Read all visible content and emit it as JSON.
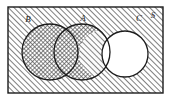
{
  "figure": {
    "kind": "venn-diagram",
    "title": "",
    "background_color": "#ffffff",
    "stroke_color": "#1c1c1c",
    "hatch_color": "#4a4a4a",
    "fill_white": "#ffffff"
  },
  "universe": {
    "label": "S",
    "shape": "rectangle",
    "x": 8,
    "y": 7,
    "width": 155,
    "height": 86,
    "fill_pattern": "diagonal-hatch",
    "label_x": 152,
    "label_y": 19
  },
  "sets": [
    {
      "label": "B",
      "shape": "circle",
      "cx": 50,
      "cy": 52,
      "r": 28,
      "fill_pattern": "cross-hatch",
      "label_x": 28,
      "label_y": 22
    },
    {
      "label": "A",
      "shape": "circle",
      "cx": 82,
      "cy": 52,
      "r": 28,
      "fill_pattern": "cross-hatch",
      "label_x": 83,
      "label_y": 21
    },
    {
      "label": "C",
      "shape": "circle",
      "cx": 125,
      "cy": 54,
      "r": 23,
      "fill_pattern": "none-white",
      "label_x": 139,
      "label_y": 21
    }
  ],
  "regions": [
    {
      "name": "outside-all-sets",
      "description": "Inside S but outside A, B and C",
      "pattern": "diagonal-hatch"
    },
    {
      "name": "B-only",
      "description": "Inside B only",
      "pattern": "cross-hatch"
    },
    {
      "name": "A-intersect-B",
      "description": "Inside both A and B",
      "pattern": "cross-hatch"
    },
    {
      "name": "A-minus-C",
      "description": "Inside A but outside C",
      "pattern": "cross-hatch"
    },
    {
      "name": "A-intersect-C",
      "description": "Inside A and inside C",
      "pattern": "none-white"
    },
    {
      "name": "C-only",
      "description": "Inside C only",
      "pattern": "none-white"
    }
  ],
  "labels": {
    "set_b": "B",
    "set_a": "A",
    "set_c": "C",
    "universe": "S"
  }
}
